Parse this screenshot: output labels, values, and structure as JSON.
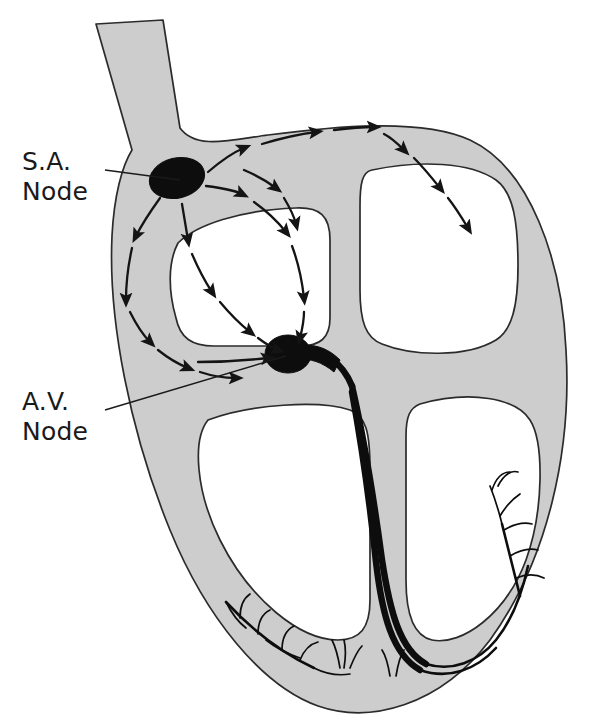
{
  "diagram": {
    "background_color": "#ffffff",
    "wall_fill_color": "#cdcdcd",
    "wall_outline_color": "#2b2b2b",
    "node_color": "#0d0d0d",
    "arrow_color": "#141414",
    "labels": [
      {
        "id": "sa-node",
        "line1": "S.A.",
        "line2": "Node",
        "text_x": 22,
        "text_y": 172,
        "leader_from_x": 104,
        "leader_from_y": 172,
        "leader_to_x": 178,
        "leader_to_y": 182
      },
      {
        "id": "av-node",
        "line1": "A.V.",
        "line2": "Node",
        "text_x": 22,
        "text_y": 412,
        "leader_from_x": 104,
        "leader_from_y": 412,
        "leader_to_x": 285,
        "leader_to_y": 356
      }
    ],
    "nodes": [
      {
        "id": "sa-node-blob",
        "name": "S.A. Node",
        "cx": 177,
        "cy": 178,
        "rx": 27,
        "ry": 20,
        "rotation": -14
      },
      {
        "id": "av-node-blob",
        "name": "A.V. Node",
        "cx": 288,
        "cy": 354,
        "rx": 22,
        "ry": 19,
        "rotation": 0
      }
    ],
    "chambers": [
      {
        "id": "right-atrium",
        "name": "Right atrium"
      },
      {
        "id": "left-atrium",
        "name": "Left atrium"
      },
      {
        "id": "right-ventricle",
        "name": "Right ventricle"
      },
      {
        "id": "left-ventricle",
        "name": "Left ventricle"
      }
    ],
    "structures": [
      {
        "id": "vena-cava",
        "name": "Superior vena cava stub"
      },
      {
        "id": "interatrial-septum",
        "name": "Interatrial septum"
      },
      {
        "id": "interventricular-septum",
        "name": "Interventricular septum"
      },
      {
        "id": "bundle-of-his",
        "name": "Bundle of His"
      },
      {
        "id": "left-bundle-branch",
        "name": "Left bundle branch"
      },
      {
        "id": "right-bundle-branch",
        "name": "Right bundle branch"
      },
      {
        "id": "purkinje-left",
        "name": "Purkinje fibers left ventricle"
      },
      {
        "id": "purkinje-right",
        "name": "Purkinje fibers right ventricle"
      },
      {
        "id": "purkinje-apex",
        "name": "Purkinje fibers apex"
      }
    ],
    "impulse_paths": [
      {
        "id": "path-upper-roof",
        "name": "SA node to left atrium roof",
        "segments": 3
      },
      {
        "id": "path-left-atrium",
        "name": "Left atrium internal spread",
        "segments": 3
      },
      {
        "id": "path-right-wall",
        "name": "Right atrial free wall descent",
        "segments": 2
      },
      {
        "id": "path-central",
        "name": "Central internodal to AV node",
        "segments": 4
      },
      {
        "id": "path-anterior",
        "name": "Anterior internodal to AV node",
        "segments": 4
      },
      {
        "id": "path-posterior",
        "name": "Posterior internodal to AV node",
        "segments": 4
      },
      {
        "id": "path-septal-down",
        "name": "Septal descent to AV node",
        "segments": 3
      }
    ]
  }
}
